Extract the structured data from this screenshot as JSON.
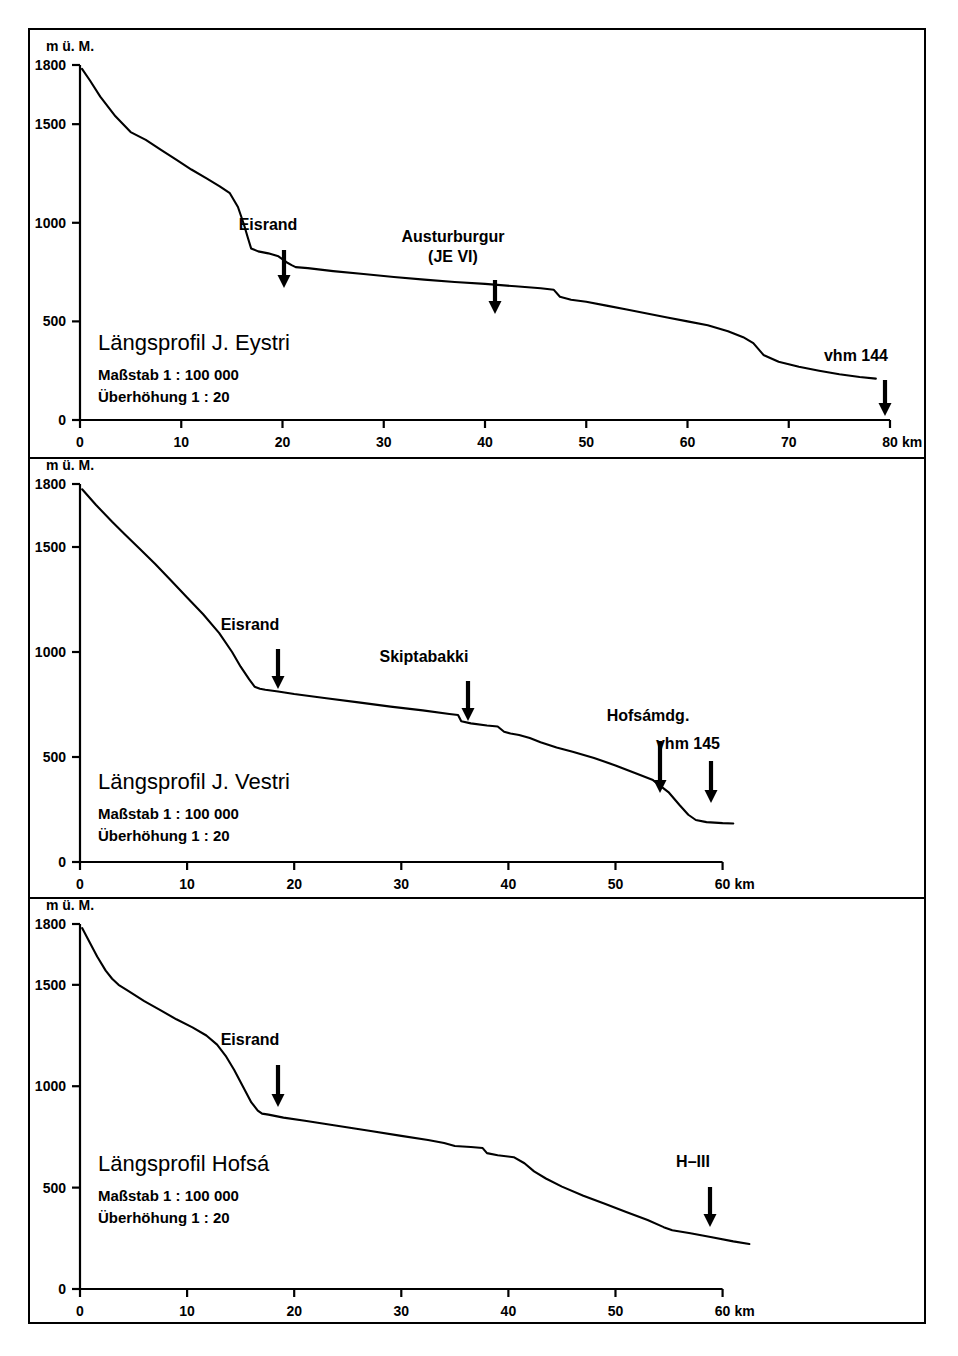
{
  "figure": {
    "kind": "longitudinal-profiles",
    "frame_color": "#000000",
    "line_color": "#000000",
    "background": "#ffffff"
  },
  "panels": [
    {
      "id": "j-eystri",
      "title": "Längsprofil J. Eystri",
      "subtitle_scale": "Maßstab 1 : 100 000",
      "subtitle_exaggeration": "Überhöhung 1 : 20",
      "y_axis_unit": "m ü. M.",
      "y_ticks": [
        "0",
        "500",
        "1000",
        "1500",
        "1800"
      ],
      "x_ticks": [
        "0",
        "10",
        "20",
        "30",
        "40",
        "50",
        "60",
        "70",
        "80"
      ],
      "x_unit": "km",
      "annotations": [
        {
          "label": "Eisrand",
          "x_km": 17.0
        },
        {
          "label": "Austurburgur",
          "label2": "(JE VI)",
          "x_km": 38.5
        },
        {
          "label": "vhm 144",
          "x_km": 76.5
        }
      ]
    },
    {
      "id": "j-vestri",
      "title": "Längsprofil J. Vestri",
      "subtitle_scale": "Maßstab 1 : 100 000",
      "subtitle_exaggeration": "Überhöhung 1 : 20",
      "y_axis_unit": "m ü. M.",
      "y_ticks": [
        "0",
        "500",
        "1000",
        "1500",
        "1800"
      ],
      "x_ticks": [
        "0",
        "10",
        "20",
        "30",
        "40",
        "50",
        "60"
      ],
      "x_unit": "km",
      "annotations": [
        {
          "label": "Eisrand",
          "x_km": 17.0
        },
        {
          "label": "Skiptabakki",
          "x_km": 35.5
        },
        {
          "label": "Hofsámdg.",
          "x_km": 56.8
        },
        {
          "label": "vhm 145",
          "x_km": 59.3
        }
      ]
    },
    {
      "id": "hofsa",
      "title": "Längsprofil Hofsá",
      "subtitle_scale": "Maßstab 1 : 100 000",
      "subtitle_exaggeration": "Überhöhung 1 : 20",
      "y_axis_unit": "m ü. M.",
      "y_ticks": [
        "0",
        "500",
        "1000",
        "1500",
        "1800"
      ],
      "x_ticks": [
        "0",
        "10",
        "20",
        "30",
        "40",
        "50",
        "60"
      ],
      "x_unit": "km",
      "annotations": [
        {
          "label": "Eisrand",
          "x_km": 17.0
        },
        {
          "label": "H–III",
          "x_km": 61.5
        }
      ]
    }
  ],
  "chart_data": [
    {
      "type": "line",
      "title": "Längsprofil J. Eystri",
      "xlabel": "km",
      "ylabel": "m ü. M.",
      "xlim": [
        0,
        80
      ],
      "ylim": [
        0,
        1800
      ],
      "grid": false,
      "legend": "none",
      "xticks": [
        0,
        10,
        20,
        30,
        40,
        50,
        60,
        70,
        80
      ],
      "yticks": [
        0,
        500,
        1000,
        1500,
        1800
      ],
      "series": [
        {
          "name": "Jökulsá Eystri longitudinal profile",
          "x": [
            0.2,
            1.0,
            2.0,
            3.5,
            5.0,
            6.5,
            8.0,
            9.5,
            11.0,
            12.5,
            13.8,
            14.8,
            15.6,
            16.2,
            16.6,
            16.9,
            17.6,
            18.6,
            19.6,
            20.4,
            20.9,
            21.3,
            22.5,
            25.0,
            28.0,
            31.0,
            34.0,
            37.0,
            40.0,
            43.0,
            45.5,
            46.8,
            47.4,
            48.5,
            50.0,
            52.0,
            54.0,
            56.0,
            58.0,
            60.0,
            62.0,
            64.0,
            65.5,
            66.5,
            67.5,
            69.0,
            71.0,
            73.0,
            75.0,
            77.0,
            78.6
          ],
          "y": [
            1780,
            1720,
            1640,
            1540,
            1460,
            1420,
            1370,
            1320,
            1270,
            1225,
            1185,
            1150,
            1080,
            990,
            920,
            870,
            855,
            845,
            830,
            800,
            785,
            775,
            770,
            755,
            740,
            725,
            712,
            700,
            690,
            678,
            668,
            660,
            625,
            610,
            600,
            580,
            560,
            540,
            520,
            500,
            480,
            450,
            420,
            390,
            330,
            295,
            270,
            250,
            232,
            218,
            210
          ]
        }
      ]
    },
    {
      "type": "line",
      "title": "Längsprofil J. Vestri",
      "xlabel": "km",
      "ylabel": "m ü. M.",
      "xlim": [
        0,
        62
      ],
      "ylim": [
        0,
        1800
      ],
      "grid": false,
      "legend": "none",
      "xticks": [
        0,
        10,
        20,
        30,
        40,
        50,
        60
      ],
      "yticks": [
        0,
        500,
        1000,
        1500,
        1800
      ],
      "series": [
        {
          "name": "Jökulsá Vestri longitudinal profile",
          "x": [
            0.2,
            1.5,
            3.0,
            4.2,
            5.5,
            7.0,
            8.5,
            10.0,
            11.5,
            13.0,
            14.2,
            15.0,
            15.8,
            16.3,
            16.8,
            17.3,
            18.5,
            20.0,
            23.0,
            26.0,
            29.0,
            32.0,
            34.5,
            35.3,
            35.6,
            36.5,
            38.0,
            39.0,
            39.6,
            40.2,
            41.0,
            42.0,
            43.0,
            44.5,
            46.0,
            48.0,
            50.0,
            52.0,
            53.5,
            55.0,
            56.0,
            56.8,
            57.5,
            58.5,
            60.0,
            61.0
          ],
          "y": [
            1775,
            1700,
            1620,
            1560,
            1495,
            1420,
            1340,
            1260,
            1180,
            1090,
            1000,
            930,
            870,
            835,
            825,
            820,
            812,
            800,
            780,
            760,
            740,
            722,
            705,
            700,
            670,
            660,
            650,
            645,
            620,
            612,
            605,
            590,
            570,
            545,
            525,
            495,
            460,
            420,
            390,
            330,
            270,
            225,
            200,
            190,
            185,
            183
          ]
        }
      ]
    },
    {
      "type": "line",
      "title": "Längsprofil Hofsá",
      "xlabel": "km",
      "ylabel": "m ü. M.",
      "xlim": [
        0,
        62
      ],
      "ylim": [
        0,
        1800
      ],
      "grid": false,
      "legend": "none",
      "xticks": [
        0,
        10,
        20,
        30,
        40,
        50,
        60
      ],
      "yticks": [
        0,
        500,
        1000,
        1500,
        1800
      ],
      "series": [
        {
          "name": "Hofsá longitudinal profile",
          "x": [
            0.2,
            0.8,
            1.6,
            2.4,
            3.0,
            3.6,
            4.5,
            6.0,
            7.5,
            9.0,
            10.5,
            11.8,
            12.8,
            13.6,
            14.4,
            15.2,
            16.0,
            16.6,
            17.0,
            17.6,
            19.0,
            21.0,
            24.0,
            27.0,
            30.0,
            32.5,
            34.0,
            35.0,
            36.5,
            37.6,
            38.0,
            39.0,
            40.5,
            41.5,
            42.4,
            43.5,
            45.0,
            47.0,
            49.0,
            51.0,
            53.0,
            54.5,
            55.3,
            57.0,
            59.0,
            61.0,
            62.5
          ],
          "y": [
            1780,
            1720,
            1640,
            1570,
            1530,
            1500,
            1470,
            1420,
            1375,
            1330,
            1290,
            1250,
            1205,
            1150,
            1080,
            1000,
            920,
            880,
            865,
            860,
            845,
            830,
            805,
            780,
            755,
            735,
            720,
            705,
            700,
            695,
            670,
            660,
            650,
            620,
            580,
            545,
            505,
            460,
            420,
            380,
            340,
            305,
            290,
            275,
            255,
            235,
            222
          ]
        }
      ]
    }
  ]
}
